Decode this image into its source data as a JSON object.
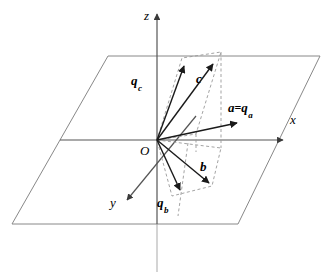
{
  "figure": {
    "kind": "vector-decomposition-diagram",
    "background_color": "#ffffff",
    "width": 325,
    "height": 277
  },
  "axes": [
    {
      "id": "z",
      "label": "z",
      "label_x": 144,
      "label_y": 9,
      "direction": "up"
    },
    {
      "id": "x",
      "label": "x",
      "label_x": 290,
      "label_y": 113,
      "direction": "right"
    },
    {
      "id": "y",
      "label": "y",
      "label_x": 110,
      "label_y": 196,
      "direction": "down-left"
    }
  ],
  "origin": {
    "label": "O",
    "label_x": 140,
    "label_y": 144,
    "point_x": 157,
    "point_y": 140
  },
  "vectors": [
    {
      "id": "a",
      "label_main": "a",
      "label_eq": "=",
      "label_q": "q",
      "label_sub": "a",
      "label_x": 228,
      "label_y": 101,
      "tip_x": 237,
      "tip_y": 123,
      "description": "vector a equals its projection q sub a"
    },
    {
      "id": "c",
      "label_main": "c",
      "label_x": 196,
      "label_y": 72,
      "tip_x": 213,
      "tip_y": 64,
      "description": "vector c pointing up and right"
    },
    {
      "id": "b",
      "label_main": "b",
      "label_x": 200,
      "label_y": 160,
      "tip_x": 209,
      "tip_y": 183,
      "description": "vector b pointing down and right"
    },
    {
      "id": "qc",
      "label_q": "q",
      "label_sub": "c",
      "label_x": 131,
      "label_y": 74,
      "tip_x": 184,
      "tip_y": 66,
      "description": "projection q sub c"
    },
    {
      "id": "qb",
      "label_q": "q",
      "label_sub": "b",
      "label_x": 157,
      "label_y": 196,
      "tip_x": 180,
      "tip_y": 190,
      "description": "projection q sub b"
    }
  ],
  "plane": {
    "name": "xy-plane",
    "corners": [
      {
        "x": 108,
        "y": 56
      },
      {
        "x": 320,
        "y": 56
      },
      {
        "x": 238,
        "y": 224
      },
      {
        "x": 12,
        "y": 224
      }
    ],
    "edge_color": "#888888"
  },
  "colors": {
    "axis": "#555555",
    "axis_below_plane": "#b8b8b8",
    "vector": "#1a1a1a",
    "construction_dashed": "#999999",
    "plane_edge": "#888888",
    "text": "#000000"
  }
}
